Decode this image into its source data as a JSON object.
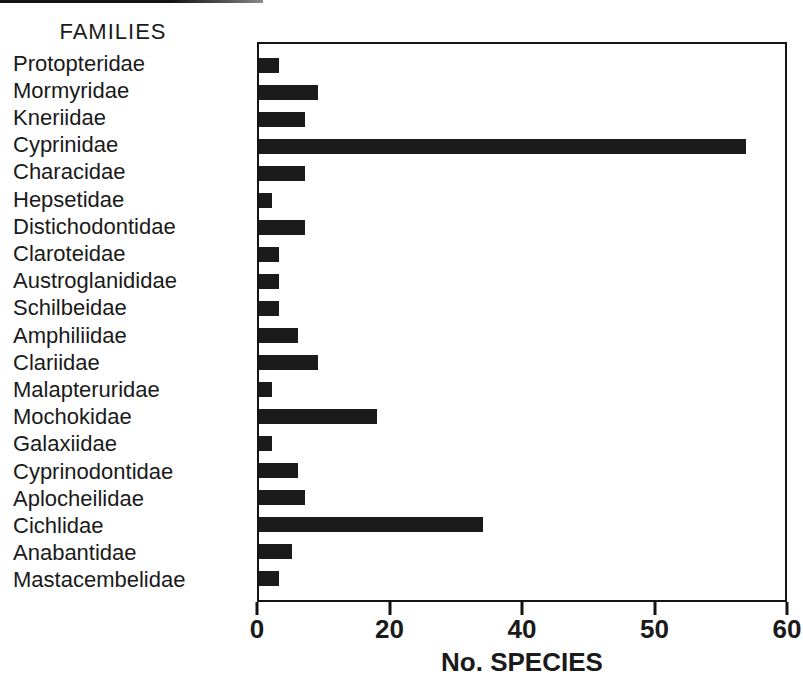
{
  "chart_data": {
    "type": "bar",
    "orientation": "horizontal",
    "families_heading": "FAMILIES",
    "xlabel": "No. SPECIES",
    "categories": [
      "Protopteridae",
      "Mormyridae",
      "Kneriidae",
      "Cyprinidae",
      "Characidae",
      "Hepsetidae",
      "Distichodontidae",
      "Claroteidae",
      "Austroglanididae",
      "Schilbeidae",
      "Amphiliidae",
      "Clariidae",
      "Malapteruridae",
      "Mochokidae",
      "Galaxiidae",
      "Cyprinodontidae",
      "Aplocheilidae",
      "Cichlidae",
      "Anabantidae",
      "Mastacembelidae"
    ],
    "values": [
      3,
      9,
      7,
      57,
      7,
      2,
      7,
      3,
      3,
      3,
      6,
      9,
      2,
      18,
      2,
      6,
      7,
      34,
      5,
      3
    ],
    "x_ticks": [
      0,
      20,
      40,
      50,
      60
    ],
    "x_tick_labels": [
      "0",
      "20",
      "40",
      "50",
      "60"
    ],
    "x_ticks_evenly_spaced": true,
    "xlim": [
      0,
      60
    ],
    "grid": false,
    "legend": "none",
    "bar_color": "#1b1b1b",
    "frame_color": "#141414",
    "background_color": "#ffffff",
    "top_edge_rule_color": "#141414"
  }
}
